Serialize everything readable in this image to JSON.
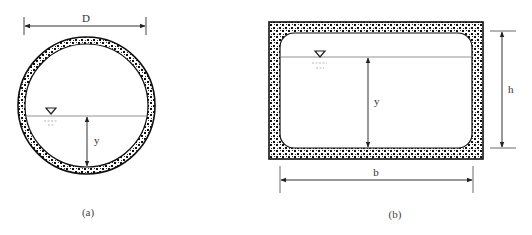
{
  "figure": {
    "panels": [
      {
        "id": "a",
        "caption": "(a)",
        "shape": "circular-conduit",
        "dimensions": {
          "diameter_label": "D",
          "depth_label": "y"
        },
        "water_surface_symbol": "∇"
      },
      {
        "id": "b",
        "caption": "(b)",
        "shape": "rectangular-box-conduit",
        "dimensions": {
          "width_label": "b",
          "height_label": "h",
          "depth_label": "y"
        },
        "water_surface_symbol": "∇"
      }
    ]
  },
  "colors": {
    "wall": "#111111",
    "line": "#555555",
    "background": "#ffffff"
  }
}
